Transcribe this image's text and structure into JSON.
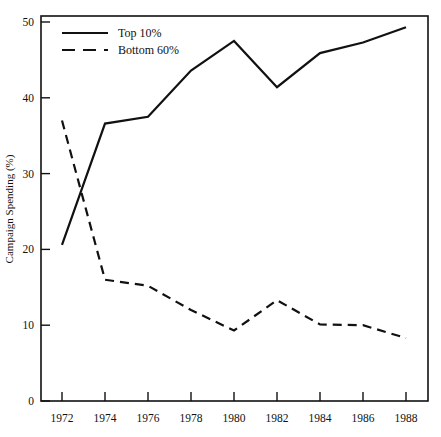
{
  "chart_data": {
    "type": "line",
    "title": "",
    "xlabel": "",
    "ylabel": "Campaign Spending (%)",
    "x": [
      1972,
      1974,
      1976,
      1978,
      1980,
      1982,
      1984,
      1986,
      1988
    ],
    "xticklabels": [
      "1972",
      "1974",
      "1976",
      "1978",
      "1980",
      "1982",
      "1984",
      "1986",
      "1988"
    ],
    "yticklabels": [
      "0",
      "10",
      "20",
      "30",
      "40",
      "50"
    ],
    "yticks": [
      0,
      10,
      20,
      30,
      40,
      50
    ],
    "xlim": [
      1971,
      1989
    ],
    "ylim": [
      0,
      50
    ],
    "grid": false,
    "legend_position": "top-left",
    "series": [
      {
        "name": "Top 10%",
        "style": "solid",
        "color": "#111111",
        "values": [
          20.6,
          36.6,
          37.5,
          43.6,
          47.5,
          41.4,
          45.9,
          47.3,
          49.3
        ]
      },
      {
        "name": "Bottom 60%",
        "style": "dashed",
        "color": "#111111",
        "values": [
          37.0,
          16.0,
          15.2,
          12.0,
          9.3,
          13.3,
          10.1,
          10.0,
          8.3
        ]
      }
    ]
  },
  "legend": {
    "items": [
      {
        "label": "Top 10%",
        "style": "solid"
      },
      {
        "label": "Bottom 60%",
        "style": "dashed"
      }
    ]
  },
  "axes": {
    "y_title": "Campaign Spending (%)"
  }
}
